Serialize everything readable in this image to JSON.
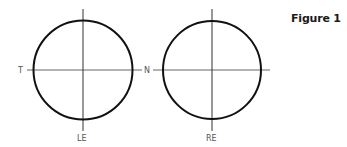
{
  "figure": {
    "title": "Figure 1"
  },
  "diagram": {
    "stroke_circle": "#111111",
    "stroke_axis": "#555555",
    "left_eye": {
      "label_bottom": "LE",
      "label_left": "T",
      "label_right": "N"
    },
    "right_eye": {
      "label_bottom": "RE"
    }
  }
}
